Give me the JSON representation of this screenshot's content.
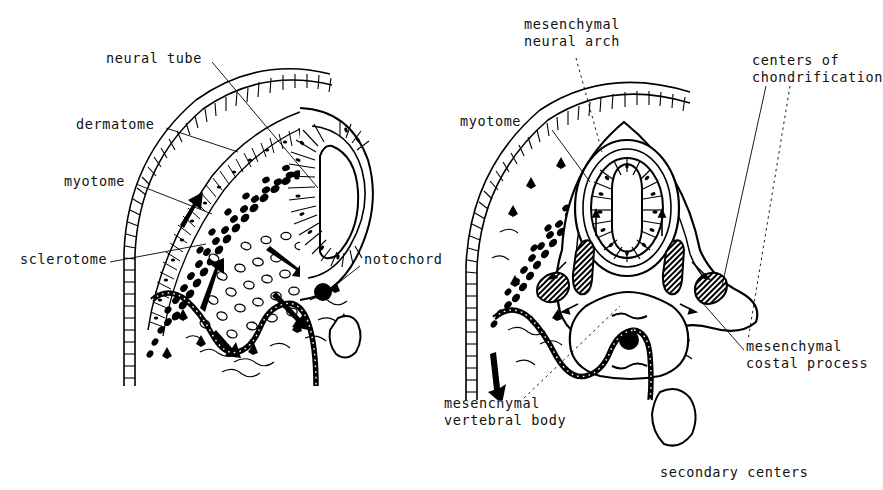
{
  "figure": {
    "background": "#ffffff",
    "ink": "#000000",
    "caption": "secondary centers"
  },
  "panels": [
    {
      "id": "left-panel",
      "name": "early-somite-stage",
      "labels": [
        {
          "key": "neural_tube",
          "text": "neural tube",
          "x": 106,
          "y": 57,
          "anchor": "start"
        },
        {
          "key": "dermatome",
          "text": "dermatome",
          "x": 76,
          "y": 123,
          "anchor": "start"
        },
        {
          "key": "myotome",
          "text": "myotome",
          "x": 64,
          "y": 180,
          "anchor": "start"
        },
        {
          "key": "sclerotome",
          "text": "sclerotome",
          "x": 20,
          "y": 258,
          "anchor": "start"
        },
        {
          "key": "notochord",
          "text": "notochord",
          "x": 364,
          "y": 258,
          "anchor": "start"
        }
      ]
    },
    {
      "id": "right-panel",
      "name": "chondrification-stage",
      "labels": [
        {
          "key": "mesenchymal_neural_arch",
          "text": "mesenchymal\nneural arch",
          "x": 524,
          "y": 22,
          "anchor": "start"
        },
        {
          "key": "centers_of_chondrification",
          "text": "centers of\nchondrification",
          "x": 752,
          "y": 57,
          "anchor": "start"
        },
        {
          "key": "myotome_right",
          "text": "myotome",
          "x": 460,
          "y": 120,
          "anchor": "start"
        },
        {
          "key": "mesenchymal_costal_process",
          "text": "mesenchymal\ncostal process",
          "x": 746,
          "y": 344,
          "anchor": "start"
        },
        {
          "key": "mesenchymal_vertebral_body",
          "text": "mesenchymal\nvertebral body",
          "x": 444,
          "y": 400,
          "anchor": "start"
        }
      ]
    }
  ],
  "structures": {
    "ectoderm": "segmented brick-like surface epithelium band",
    "dermatome": "palisaded columnar cell layer beneath ectoderm",
    "myotome": "dense dark cell cluster",
    "sclerotome": "loose stippled mesenchyme migrating toward notochord",
    "notochord": "solid black round core",
    "coelomic_epithelium": "wavy beaded membrane",
    "neural_tube": "central canal lined by radiating neuroepithelium",
    "chondrification_centers": "cross-hatched ovoid cartilage islands",
    "migration_arrows": "bold solid arrows showing sclerotome migration"
  }
}
